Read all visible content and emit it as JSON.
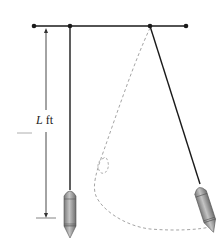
{
  "diagram": {
    "length_label": {
      "variable": "L",
      "unit": "ft"
    },
    "colors": {
      "line": "#1a1a1a",
      "dashed_path": "#9a9a9a",
      "bob_fill": "#a8a8a8",
      "bob_shade": "#7a7a7a"
    },
    "elements": [
      "support-bar",
      "rest-pendulum",
      "swinging-pendulum",
      "length-dimension-arrow",
      "dashed-trajectory"
    ]
  }
}
